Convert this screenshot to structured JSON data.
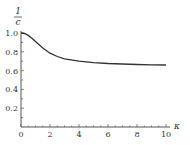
{
  "chart_data": {
    "type": "line",
    "title": "",
    "xlabel": "κ",
    "ylabel_numerator": "1",
    "ylabel_denominator": "c",
    "xlim": [
      0,
      10
    ],
    "ylim": [
      0,
      1.0
    ],
    "grid": false,
    "legend": null,
    "x_ticks": [
      "0",
      "2",
      "4",
      "6",
      "8",
      "10"
    ],
    "y_ticks": [
      "0.2",
      "0.4",
      "0.6",
      "0.8",
      "1.0"
    ],
    "series": [
      {
        "name": "1/c",
        "x": [
          0,
          0.25,
          0.5,
          0.75,
          1,
          1.5,
          2,
          2.5,
          3,
          4,
          5,
          6,
          7,
          8,
          9,
          10
        ],
        "values": [
          1.0,
          0.995,
          0.975,
          0.945,
          0.91,
          0.84,
          0.785,
          0.75,
          0.725,
          0.7,
          0.685,
          0.675,
          0.67,
          0.665,
          0.662,
          0.66
        ]
      }
    ],
    "line_color": "#333333"
  }
}
